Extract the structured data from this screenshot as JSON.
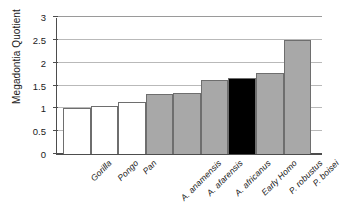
{
  "chart_data": {
    "type": "bar",
    "title": "",
    "xlabel": "",
    "ylabel": "Megadontia Quotient",
    "ylim": [
      0,
      3
    ],
    "ytick_values": [
      0,
      0.5,
      1,
      1.5,
      2,
      2.5,
      3
    ],
    "ytick_labels": [
      "0",
      "0.5",
      "1",
      "1.5",
      "2",
      "2.5",
      "3"
    ],
    "grid": true,
    "legend": "none",
    "categories": [
      "Gorilla",
      "Pongo",
      "Pan",
      "A. anamensis",
      "A. afarensis",
      "A. africanus",
      "Early Homo",
      "P. robustus",
      "P. boisei"
    ],
    "values": [
      1.0,
      1.06,
      1.13,
      1.31,
      1.34,
      1.62,
      1.67,
      1.78,
      2.49
    ],
    "bar_colors": [
      "#ffffff",
      "#ffffff",
      "#ffffff",
      "#a8a8a8",
      "#a8a8a8",
      "#a8a8a8",
      "#000000",
      "#a8a8a8",
      "#a8a8a8"
    ],
    "bar_edge_color": "#6e6e6e",
    "axis_color": "#4d4d4d",
    "grid_color": "#b9b9b9",
    "text_color": "#1a1a1a",
    "background": "#ffffff"
  }
}
